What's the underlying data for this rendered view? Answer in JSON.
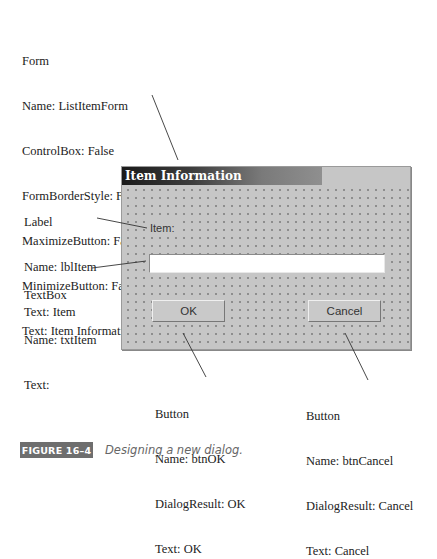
{
  "annotations": {
    "form": {
      "lines": [
        "Form",
        "Name:  ListItemForm",
        "ControlBox:  False",
        "FormBorderStyle:  FizedDialog",
        "MaximizeButton:  False",
        "MinimizeButton:  False",
        "Text:  Item Informaticn"
      ]
    },
    "label": {
      "lines": [
        "Label",
        "Name:  lblItem",
        "Text:  Item"
      ]
    },
    "textbox": {
      "lines": [
        "TextBox",
        "Name:  txtItem",
        "Text:"
      ]
    },
    "btn_ok": {
      "lines": [
        "Button",
        "Name:  btnOK",
        "DialogResult:  OK",
        "Text:  OK"
      ]
    },
    "btn_cancel": {
      "lines": [
        "Button",
        "Name:  btnCancel",
        "DialogResult:  Cancel",
        "Text:  Cancel"
      ]
    }
  },
  "dialog": {
    "title": "Item Information",
    "label_text": "Item:",
    "textbox_value": "",
    "ok_label": "OK",
    "cancel_label": "Cancel"
  },
  "caption": {
    "figure_label": "FIGURE 16–4",
    "text": "Designing a new dialog."
  }
}
